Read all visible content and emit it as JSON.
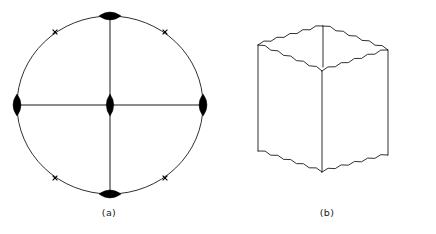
{
  "figure": {
    "background_color": "#ffffff",
    "stroke_color": "#1a1a1a",
    "marker_fill_color": "#000000",
    "panels": [
      {
        "id": "a",
        "caption": "(a)",
        "kind": "pole-figure-circle",
        "circle": {
          "cx": 110,
          "cy": 105,
          "rx": 93,
          "ry": 89
        },
        "axes": [
          {
            "name": "horizontal-axis",
            "x1": 17,
            "y1": 105,
            "x2": 203,
            "y2": 105
          },
          {
            "name": "vertical-axis",
            "x1": 110,
            "y1": 16,
            "x2": 110,
            "y2": 194
          }
        ],
        "lens_markers": [
          {
            "name": "pole-marker-top",
            "cx": 110,
            "cy": 16,
            "rx": 11,
            "ry": 3.6,
            "orientation": "horizontal"
          },
          {
            "name": "pole-marker-bottom",
            "cx": 110,
            "cy": 194,
            "rx": 11,
            "ry": 3.6,
            "orientation": "horizontal"
          },
          {
            "name": "pole-marker-left",
            "cx": 17,
            "cy": 105,
            "rx": 3.6,
            "ry": 11,
            "orientation": "vertical"
          },
          {
            "name": "pole-marker-right",
            "cx": 203,
            "cy": 105,
            "rx": 3.6,
            "ry": 11,
            "orientation": "vertical"
          },
          {
            "name": "pole-marker-center",
            "cx": 110,
            "cy": 105,
            "rx": 3.4,
            "ry": 11,
            "orientation": "vertical"
          }
        ],
        "cross_markers": [
          {
            "name": "cross-marker-upper-left",
            "cx": 55,
            "cy": 32,
            "angle_deg": 135
          },
          {
            "name": "cross-marker-upper-right",
            "cx": 165,
            "cy": 32,
            "angle_deg": 45
          },
          {
            "name": "cross-marker-lower-left",
            "cx": 55,
            "cy": 178,
            "angle_deg": 45
          },
          {
            "name": "cross-marker-lower-right",
            "cx": 165,
            "cy": 178,
            "angle_deg": 135
          }
        ]
      },
      {
        "id": "b",
        "caption": "(b)",
        "kind": "cube-with-serrated-edges",
        "cube": {
          "top_front": {
            "x": 104,
            "y": 71
          },
          "top_left": {
            "x": 40,
            "y": 45
          },
          "top_back": {
            "x": 105,
            "y": 26
          },
          "top_right": {
            "x": 170,
            "y": 50
          },
          "bottom_front": {
            "x": 104,
            "y": 172
          },
          "bottom_left": {
            "x": 40,
            "y": 151
          },
          "bottom_right": {
            "x": 170,
            "y": 155
          },
          "back_edge_bottom": {
            "x": 105,
            "y": 67
          }
        },
        "serration": {
          "amplitude": 2.1,
          "wavelength": 7.0
        }
      }
    ]
  }
}
